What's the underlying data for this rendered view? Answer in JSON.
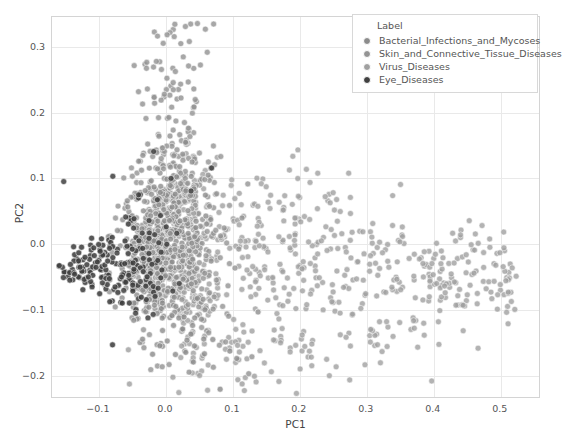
{
  "chart_data": {
    "type": "scatter",
    "title": "",
    "xlabel": "PC1",
    "ylabel": "PC2",
    "xlim": [
      -0.17,
      0.56
    ],
    "ylim": [
      -0.235,
      0.345
    ],
    "xticks": [
      -0.1,
      0.0,
      0.1,
      0.2,
      0.3,
      0.4,
      0.5
    ],
    "xticklabels": [
      "-0.1",
      "0.0",
      "0.1",
      "0.2",
      "0.3",
      "0.4",
      "0.5"
    ],
    "yticks": [
      -0.2,
      -0.1,
      0.0,
      0.1,
      0.2,
      0.3
    ],
    "yticklabels": [
      "-0.2",
      "-0.1",
      "0.0",
      "0.1",
      "0.2",
      "0.3"
    ],
    "grid": true,
    "legend": {
      "title": "Label",
      "position": "upper right",
      "entries": [
        {
          "label": "Bacterial_Infections_and_Mycoses",
          "color": "#8c8c8c"
        },
        {
          "label": "Skin_and_Connective_Tissue_Diseases",
          "color": "#949494"
        },
        {
          "label": "Virus_Diseases",
          "color": "#a0a0a0"
        },
        {
          "label": "Eye_Diseases",
          "color": "#404040"
        }
      ]
    },
    "marker": {
      "size": 6,
      "edge_color": "#ffffff",
      "opacity": 0.85
    },
    "series": [
      {
        "name": "Bacterial_Infections_and_Mycoses",
        "color": "#8c8c8c",
        "n": 430,
        "cluster": {
          "x_center": 0.005,
          "y_center": -0.01,
          "x_spread": 0.035,
          "y_spread": 0.075
        }
      },
      {
        "name": "Skin_and_Connective_Tissue_Diseases",
        "color": "#949494",
        "n": 420,
        "cluster": {
          "x_center": 0.02,
          "y_center": 0.0,
          "x_spread": 0.05,
          "y_spread": 0.08
        }
      },
      {
        "name": "Virus_Diseases",
        "color": "#a0a0a0",
        "n": 520,
        "cluster": {
          "x_center": 0.13,
          "y_center": -0.04,
          "x_spread": 0.12,
          "y_spread": 0.06
        }
      },
      {
        "name": "Eye_Diseases",
        "color": "#404040",
        "n": 165,
        "cluster": {
          "x_center": -0.085,
          "y_center": -0.045,
          "x_spread": 0.045,
          "y_spread": 0.06
        }
      }
    ]
  }
}
